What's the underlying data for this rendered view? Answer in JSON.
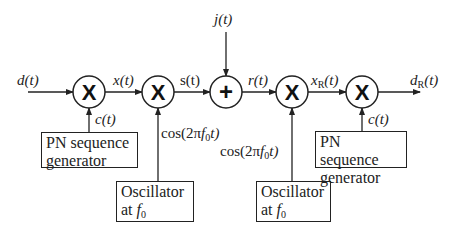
{
  "diagram": {
    "title": "",
    "signals": {
      "input": "d(t)",
      "after_spread": "x(t)",
      "modulated": "s(t)",
      "jammer": "j(t)",
      "received": "r(t)",
      "demodulated_main": "x",
      "demodulated_sub": "R",
      "output_main": "d",
      "output_sub": "R",
      "t_suffix": "(t)",
      "pn_code_tx": "c(t)",
      "pn_code_rx": "c(t)",
      "carrier_tx_prefix": "cos(2π",
      "carrier_tx_f": "f",
      "carrier_tx_sub": "0",
      "carrier_tx_suffix": "t)",
      "carrier_rx_prefix": "cos(2π",
      "carrier_rx_f": "f",
      "carrier_rx_sub": "0",
      "carrier_rx_suffix": "t)"
    },
    "nodes": [
      {
        "id": "mult1",
        "symbol": "X",
        "type": "multiplier"
      },
      {
        "id": "mult2",
        "symbol": "X",
        "type": "multiplier"
      },
      {
        "id": "adder",
        "symbol": "+",
        "type": "summer"
      },
      {
        "id": "mult3",
        "symbol": "X",
        "type": "multiplier"
      },
      {
        "id": "mult4",
        "symbol": "X",
        "type": "multiplier"
      }
    ],
    "blocks": {
      "pn_tx": {
        "line1": "PN sequence",
        "line2": "generator"
      },
      "osc_tx": {
        "line1": "Oscillator",
        "line2_prefix": "at ",
        "f": "f",
        "sub": "0"
      },
      "osc_rx": {
        "line1": "Oscillator",
        "line2_prefix": "at ",
        "f": "f",
        "sub": "0"
      },
      "pn_rx": {
        "line1": "PN sequence",
        "line2": "generator"
      }
    },
    "colors": {
      "line": "#222222",
      "background": "#ffffff"
    }
  }
}
